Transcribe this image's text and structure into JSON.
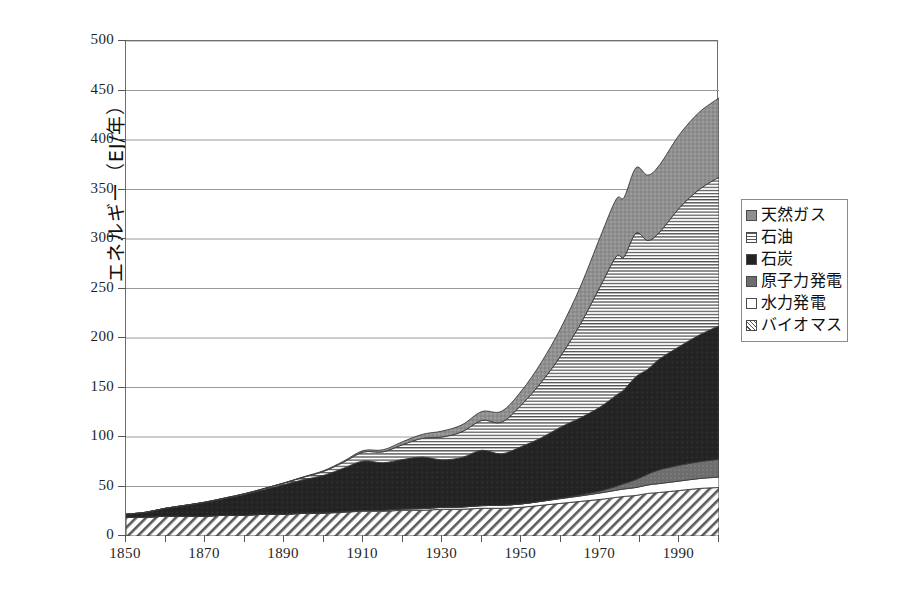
{
  "chart_data": {
    "type": "area",
    "stacked": true,
    "title": "",
    "subtitle": "",
    "xlabel": "",
    "ylabel": "エネルギー（EJ/年）",
    "xlim": [
      1850,
      2000
    ],
    "ylim": [
      0,
      500
    ],
    "grid": true,
    "legend_position": "right",
    "x_tick_labels": [
      "1850",
      "1870",
      "1890",
      "1910",
      "1930",
      "1950",
      "1970",
      "1990"
    ],
    "x_tick_values": [
      1850,
      1870,
      1890,
      1910,
      1930,
      1950,
      1970,
      1990
    ],
    "x_minor_tick_values": [
      1860,
      1880,
      1900,
      1920,
      1940,
      1960,
      1980,
      2000
    ],
    "y_tick_labels": [
      "0",
      "50",
      "100",
      "150",
      "200",
      "250",
      "300",
      "350",
      "400",
      "450",
      "500"
    ],
    "y_tick_values": [
      0,
      50,
      100,
      150,
      200,
      250,
      300,
      350,
      400,
      450,
      500
    ],
    "x": [
      1850,
      1855,
      1860,
      1865,
      1870,
      1875,
      1880,
      1885,
      1890,
      1895,
      1900,
      1905,
      1910,
      1915,
      1920,
      1925,
      1930,
      1935,
      1940,
      1945,
      1950,
      1955,
      1960,
      1965,
      1970,
      1974,
      1976,
      1979,
      1982,
      1985,
      1990,
      1995,
      2000
    ],
    "series": [
      {
        "name": "バイオマス",
        "key": "biomass",
        "pattern": "diagonal-hatch",
        "color": "#555555",
        "values": [
          19,
          19,
          20,
          20,
          20,
          21,
          21,
          22,
          22,
          23,
          23,
          24,
          25,
          25,
          26,
          26,
          27,
          27,
          28,
          28,
          29,
          31,
          33,
          35,
          37,
          39,
          40,
          41,
          43,
          44,
          46,
          48,
          49
        ]
      },
      {
        "name": "水力発電",
        "key": "hydro",
        "pattern": "solid-white",
        "color": "#ffffff",
        "values": [
          0,
          0,
          0,
          0,
          0,
          0,
          0,
          0,
          0,
          0,
          0.3,
          0.5,
          0.8,
          1,
          1.3,
          1.7,
          2,
          2.3,
          2.7,
          3,
          3.4,
          4,
          4.8,
          5.5,
          6.5,
          7.2,
          7.5,
          8,
          8.5,
          9,
          9.5,
          10,
          10.5
        ]
      },
      {
        "name": "原子力発電",
        "key": "nuclear",
        "pattern": "solid-gray",
        "color": "#6d6d6d",
        "values": [
          0,
          0,
          0,
          0,
          0,
          0,
          0,
          0,
          0,
          0,
          0,
          0,
          0,
          0,
          0,
          0,
          0,
          0,
          0,
          0,
          0,
          0.1,
          0.4,
          1,
          2,
          4,
          5.5,
          8,
          11,
          14,
          16,
          17,
          18
        ]
      },
      {
        "name": "石炭",
        "key": "coal",
        "pattern": "solid-black",
        "color": "#242424",
        "values": [
          3,
          5,
          8,
          11,
          14,
          17,
          21,
          25,
          30,
          34,
          38,
          44,
          50,
          48,
          50,
          52,
          48,
          50,
          56,
          52,
          58,
          64,
          72,
          78,
          85,
          92,
          95,
          104,
          106,
          112,
          120,
          128,
          135
        ]
      },
      {
        "name": "石油",
        "key": "oil",
        "pattern": "horizontal-lines",
        "color": "#5a5a5a",
        "values": [
          0,
          0,
          0,
          0,
          0.2,
          0.4,
          0.7,
          1,
          1.5,
          2.5,
          4,
          6,
          9,
          11,
          15,
          19,
          23,
          26,
          30,
          32,
          42,
          56,
          72,
          95,
          122,
          140,
          134,
          145,
          130,
          128,
          140,
          147,
          150
        ]
      },
      {
        "name": "天然ガス",
        "key": "gas",
        "pattern": "solid-gray-dark",
        "color": "#8f8f8f",
        "values": [
          0,
          0,
          0,
          0,
          0,
          0,
          0,
          0,
          0.2,
          0.4,
          0.7,
          1,
          1.5,
          2,
          3,
          4,
          6,
          7,
          9,
          11,
          14,
          20,
          28,
          38,
          50,
          58,
          60,
          66,
          66,
          68,
          74,
          78,
          80
        ]
      }
    ],
    "totals": [
      22,
      24,
      28,
      31,
      34.2,
      38.4,
      42.7,
      48,
      53.7,
      59.9,
      66,
      75.5,
      86.3,
      87,
      95.3,
      102.7,
      106,
      112.3,
      125.7,
      126,
      146.4,
      175.1,
      210.2,
      252.5,
      302.5,
      340.2,
      342,
      372,
      364.5,
      375,
      405.5,
      428,
      442.5
    ]
  },
  "legend": {
    "items": [
      {
        "label": "天然ガス",
        "swatch_class": "sw-gas",
        "icon": "legend-swatch-gas"
      },
      {
        "label": "石油",
        "swatch_class": "sw-oil",
        "icon": "legend-swatch-oil"
      },
      {
        "label": "石炭",
        "swatch_class": "sw-coal",
        "icon": "legend-swatch-coal"
      },
      {
        "label": "原子力発電",
        "swatch_class": "sw-nuclear",
        "icon": "legend-swatch-nuclear"
      },
      {
        "label": "水力発電",
        "swatch_class": "sw-hydro",
        "icon": "legend-swatch-hydro"
      },
      {
        "label": "バイオマス",
        "swatch_class": "sw-biomass",
        "icon": "legend-swatch-biomass"
      }
    ]
  },
  "colors": {
    "gas": "#8f8f8f",
    "oil": "#5a5a5a",
    "coal": "#242424",
    "nuclear": "#6d6d6d",
    "hydro": "#ffffff",
    "biomass": "#555555",
    "grid": "#9a9a9a",
    "frame": "#6e6e6e",
    "text": "#1a1a1a",
    "background": "#ffffff"
  }
}
